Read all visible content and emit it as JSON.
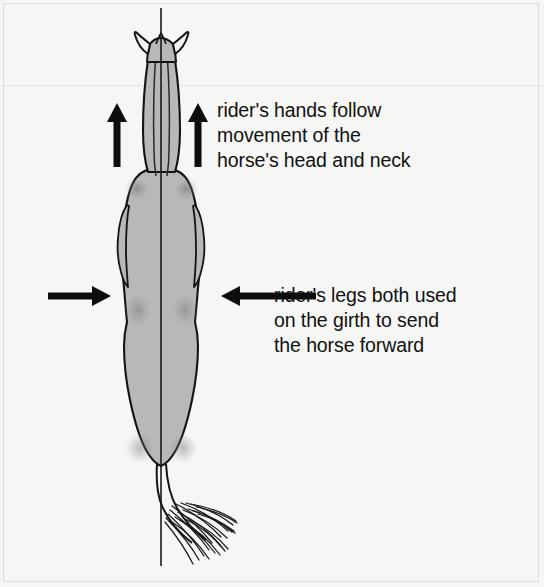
{
  "page": {
    "background_color": "#f6f6f4",
    "border_color": "#dcdcda",
    "width": 544,
    "height": 587
  },
  "diagram": {
    "body_fill_color": "#b8b8b8",
    "outline_color": "#111111",
    "centerline": {
      "name": "vertical-centerline",
      "x": 161,
      "y_top": 8,
      "y_bottom": 566
    },
    "parts": [
      {
        "name": "left-ear"
      },
      {
        "name": "right-ear"
      },
      {
        "name": "head"
      },
      {
        "name": "neck"
      },
      {
        "name": "shoulders"
      },
      {
        "name": "barrel"
      },
      {
        "name": "hindquarters"
      },
      {
        "name": "tail"
      }
    ]
  },
  "arrows": {
    "hands": [
      {
        "name": "arrow-up-left",
        "direction": "up",
        "x": 117,
        "y_tip": 104,
        "y_tail": 167
      },
      {
        "name": "arrow-up-right",
        "direction": "up",
        "x": 198,
        "y_tip": 104,
        "y_tail": 167
      }
    ],
    "legs": [
      {
        "name": "arrow-right-from-left",
        "direction": "right",
        "y": 296,
        "x_tail": 48,
        "x_tip": 110
      },
      {
        "name": "arrow-left-from-right",
        "direction": "left",
        "y": 296,
        "x_tail": 316,
        "x_tip": 222
      }
    ]
  },
  "annotations": {
    "hands": {
      "lines": [
        "rider's hands follow",
        "movement of the",
        "horse's head and neck"
      ],
      "text": "rider's hands follow\nmovement of the\nhorse's head and neck"
    },
    "legs": {
      "lines": [
        "rider's legs both used",
        "on the girth to send",
        "the horse forward"
      ],
      "text": "rider's legs both used\non the girth to send\nthe horse forward"
    }
  }
}
